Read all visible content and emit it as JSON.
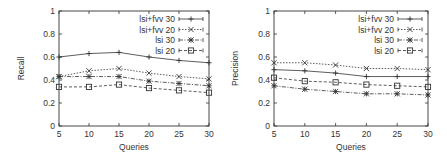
{
  "chart_data": [
    {
      "type": "line",
      "title": "",
      "xlabel": "Queries",
      "ylabel": "Recall",
      "x": [
        5,
        10,
        15,
        20,
        25,
        30
      ],
      "xticks": [
        "5",
        "10",
        "15",
        "20",
        "25",
        "30"
      ],
      "yticks": [
        "0",
        "0.2",
        "0.4",
        "0.6",
        "0.8",
        "1"
      ],
      "ylim": [
        0,
        1
      ],
      "xlim": [
        5,
        30
      ],
      "grid": false,
      "legend_position": "top-right",
      "series": [
        {
          "name": "lsi+fvv 30",
          "marker": "plus",
          "dash": "solid",
          "values": [
            0.6,
            0.63,
            0.64,
            0.6,
            0.57,
            0.55
          ]
        },
        {
          "name": "lsi+fvv 20",
          "marker": "x",
          "dash": "dotted",
          "values": [
            0.43,
            0.48,
            0.5,
            0.46,
            0.43,
            0.41
          ]
        },
        {
          "name": "lsi 30",
          "marker": "star",
          "dash": "dashdot",
          "values": [
            0.43,
            0.43,
            0.43,
            0.39,
            0.37,
            0.35
          ]
        },
        {
          "name": "lsi 20",
          "marker": "square",
          "dash": "dashed",
          "values": [
            0.34,
            0.34,
            0.36,
            0.33,
            0.31,
            0.29
          ]
        }
      ]
    },
    {
      "type": "line",
      "title": "",
      "xlabel": "Queries",
      "ylabel": "Precision",
      "x": [
        5,
        10,
        15,
        20,
        25,
        30
      ],
      "xticks": [
        "5",
        "10",
        "15",
        "20",
        "25",
        "30"
      ],
      "yticks": [
        "0",
        "0.2",
        "0.4",
        "0.6",
        "0.8",
        "1"
      ],
      "ylim": [
        0,
        1
      ],
      "xlim": [
        5,
        30
      ],
      "grid": false,
      "legend_position": "top-right",
      "series": [
        {
          "name": "lsi+fvv 30",
          "marker": "plus",
          "dash": "solid",
          "values": [
            0.49,
            0.48,
            0.46,
            0.43,
            0.43,
            0.43
          ]
        },
        {
          "name": "lsi+fvv 20",
          "marker": "x",
          "dash": "dotted",
          "values": [
            0.55,
            0.55,
            0.53,
            0.5,
            0.5,
            0.49
          ]
        },
        {
          "name": "lsi 30",
          "marker": "star",
          "dash": "dashdot",
          "values": [
            0.35,
            0.32,
            0.3,
            0.28,
            0.28,
            0.27
          ]
        },
        {
          "name": "lsi 20",
          "marker": "square",
          "dash": "dashed",
          "values": [
            0.42,
            0.39,
            0.38,
            0.36,
            0.35,
            0.34
          ]
        }
      ]
    }
  ]
}
